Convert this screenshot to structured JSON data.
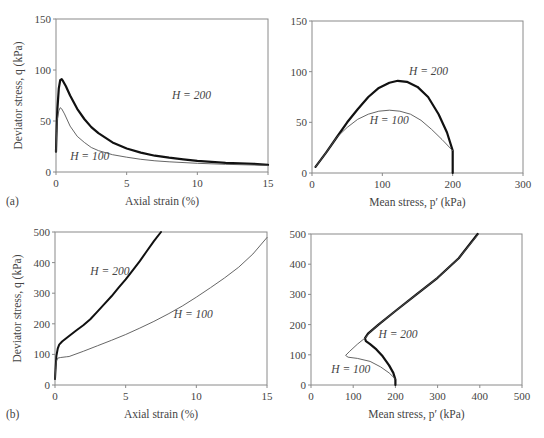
{
  "chart_data": [
    {
      "id": "a_left",
      "panel_tag": "(a)",
      "type": "line",
      "xlabel": "Axial strain (%)",
      "ylabel": "Deviator stress, q (kPa)",
      "xlim": [
        0,
        15
      ],
      "ylim": [
        0,
        150
      ],
      "xticks": [
        0,
        5,
        10,
        15
      ],
      "yticks": [
        0,
        50,
        100,
        150
      ],
      "grid": false,
      "frame": {
        "x0": 56,
        "y0": 19,
        "x1": 268,
        "y1": 172
      },
      "series": [
        {
          "name": "H = 200",
          "width": 2.2,
          "label_pos": [
            8.2,
            72
          ],
          "points": [
            [
              0,
              20
            ],
            [
              0.05,
              45
            ],
            [
              0.1,
              62
            ],
            [
              0.2,
              82
            ],
            [
              0.3,
              90
            ],
            [
              0.4,
              91
            ],
            [
              0.5,
              89
            ],
            [
              0.7,
              84
            ],
            [
              1,
              75
            ],
            [
              1.5,
              62
            ],
            [
              2,
              52
            ],
            [
              2.5,
              44
            ],
            [
              3,
              38
            ],
            [
              4,
              29
            ],
            [
              5,
              23
            ],
            [
              6,
              19
            ],
            [
              7,
              16
            ],
            [
              8,
              14
            ],
            [
              9,
              12.5
            ],
            [
              10,
              11
            ],
            [
              11,
              10
            ],
            [
              12,
              9
            ],
            [
              13,
              8.5
            ],
            [
              14,
              8
            ],
            [
              15,
              7
            ]
          ]
        },
        {
          "name": "H = 100",
          "width": 0.9,
          "label_pos": [
            1.0,
            12
          ],
          "points": [
            [
              0,
              20
            ],
            [
              0.05,
              40
            ],
            [
              0.1,
              52
            ],
            [
              0.2,
              60
            ],
            [
              0.3,
              63
            ],
            [
              0.4,
              62
            ],
            [
              0.6,
              57
            ],
            [
              0.8,
              51
            ],
            [
              1,
              45
            ],
            [
              1.5,
              35
            ],
            [
              2,
              29
            ],
            [
              2.5,
              24
            ],
            [
              3,
              21
            ],
            [
              4,
              17
            ],
            [
              5,
              14.5
            ],
            [
              6,
              12.5
            ],
            [
              7,
              11
            ],
            [
              8,
              10
            ],
            [
              10,
              8.5
            ],
            [
              12,
              7.5
            ],
            [
              15,
              6.5
            ]
          ]
        }
      ]
    },
    {
      "id": "a_right",
      "type": "line",
      "xlabel": "Mean stress, p′ (kPa)",
      "ylabel": "",
      "xlim": [
        0,
        300
      ],
      "ylim": [
        0,
        150
      ],
      "xticks": [
        0,
        100,
        200,
        300
      ],
      "yticks": [
        0,
        50,
        100,
        150
      ],
      "grid": false,
      "frame": {
        "x0": 312,
        "y0": 21,
        "x1": 523,
        "y1": 173
      },
      "series": [
        {
          "name": "H = 200",
          "width": 2.2,
          "label_pos": [
            138,
            97
          ],
          "points": [
            [
              5,
              6
            ],
            [
              20,
              20
            ],
            [
              35,
              35
            ],
            [
              50,
              50
            ],
            [
              65,
              63
            ],
            [
              80,
              75
            ],
            [
              95,
              84
            ],
            [
              110,
              89
            ],
            [
              122,
              91
            ],
            [
              135,
              90
            ],
            [
              150,
              85
            ],
            [
              165,
              75
            ],
            [
              180,
              58
            ],
            [
              192,
              40
            ],
            [
              200,
              22
            ],
            [
              200,
              0
            ]
          ]
        },
        {
          "name": "H = 100",
          "width": 0.9,
          "label_pos": [
            82,
            48
          ],
          "points": [
            [
              5,
              6
            ],
            [
              20,
              20
            ],
            [
              35,
              35
            ],
            [
              50,
              45
            ],
            [
              65,
              53
            ],
            [
              80,
              58
            ],
            [
              95,
              61
            ],
            [
              110,
              62
            ],
            [
              125,
              61
            ],
            [
              140,
              58
            ],
            [
              155,
              52
            ],
            [
              170,
              43
            ],
            [
              185,
              33
            ],
            [
              200,
              22
            ]
          ]
        }
      ]
    },
    {
      "id": "b_left",
      "panel_tag": "(b)",
      "type": "line",
      "xlabel": "Axial strain (%)",
      "ylabel": "Deviator stress, q (kPa)",
      "xlim": [
        0,
        15
      ],
      "ylim": [
        0,
        500
      ],
      "xticks": [
        0,
        5,
        10,
        15
      ],
      "yticks": [
        0,
        100,
        200,
        300,
        400,
        500
      ],
      "grid": false,
      "frame": {
        "x0": 55,
        "y0": 232,
        "x1": 267,
        "y1": 385
      },
      "series": [
        {
          "name": "H = 200",
          "width": 2.0,
          "label_pos": [
            2.5,
            360
          ],
          "points": [
            [
              0,
              20
            ],
            [
              0.05,
              60
            ],
            [
              0.1,
              95
            ],
            [
              0.2,
              120
            ],
            [
              0.3,
              132
            ],
            [
              0.5,
              142
            ],
            [
              1,
              160
            ],
            [
              1.5,
              178
            ],
            [
              2,
              195
            ],
            [
              2.5,
              215
            ],
            [
              3,
              240
            ],
            [
              3.5,
              265
            ],
            [
              4,
              290
            ],
            [
              4.5,
              318
            ],
            [
              5,
              345
            ],
            [
              5.5,
              375
            ],
            [
              6,
              405
            ],
            [
              6.5,
              438
            ],
            [
              7,
              470
            ],
            [
              7.5,
              500
            ]
          ]
        },
        {
          "name": "H = 100",
          "width": 0.9,
          "label_pos": [
            8.4,
            220
          ],
          "points": [
            [
              0,
              20
            ],
            [
              0.05,
              55
            ],
            [
              0.1,
              78
            ],
            [
              0.2,
              88
            ],
            [
              0.4,
              90
            ],
            [
              0.8,
              92
            ],
            [
              1,
              93
            ],
            [
              2,
              110
            ],
            [
              3,
              128
            ],
            [
              4,
              146
            ],
            [
              5,
              165
            ],
            [
              6,
              186
            ],
            [
              7,
              208
            ],
            [
              8,
              232
            ],
            [
              9,
              258
            ],
            [
              10,
              287
            ],
            [
              11,
              318
            ],
            [
              12,
              350
            ],
            [
              13,
              385
            ],
            [
              14,
              428
            ],
            [
              15,
              482
            ]
          ]
        }
      ]
    },
    {
      "id": "b_right",
      "type": "line",
      "xlabel": "Mean stress, p′ (kPa)",
      "ylabel": "",
      "xlim": [
        0,
        500
      ],
      "ylim": [
        0,
        500
      ],
      "xticks": [
        0,
        100,
        200,
        300,
        400,
        500
      ],
      "yticks": [
        0,
        100,
        200,
        300,
        400,
        500
      ],
      "grid": false,
      "frame": {
        "x0": 311,
        "y0": 234,
        "x1": 522,
        "y1": 385
      },
      "series": [
        {
          "name": "H = 200",
          "width": 2.2,
          "label_pos": [
            160,
            155
          ],
          "points": [
            [
              200,
              0
            ],
            [
              200,
              18
            ],
            [
              195,
              40
            ],
            [
              185,
              65
            ],
            [
              170,
              95
            ],
            [
              155,
              118
            ],
            [
              140,
              135
            ],
            [
              130,
              145
            ],
            [
              128,
              155
            ],
            [
              135,
              170
            ],
            [
              160,
              200
            ],
            [
              200,
              245
            ],
            [
              250,
              300
            ],
            [
              300,
              355
            ],
            [
              350,
              420
            ],
            [
              395,
              500
            ]
          ]
        },
        {
          "name": "H = 100",
          "width": 0.9,
          "label_pos": [
            48,
            40
          ],
          "points": [
            [
              200,
              20
            ],
            [
              185,
              40
            ],
            [
              165,
              60
            ],
            [
              140,
              78
            ],
            [
              110,
              88
            ],
            [
              88,
              92
            ],
            [
              82,
              98
            ],
            [
              92,
              112
            ],
            [
              110,
              135
            ],
            [
              130,
              158
            ],
            [
              140,
              175
            ],
            [
              160,
              200
            ],
            [
              200,
              245
            ],
            [
              250,
              300
            ],
            [
              300,
              355
            ],
            [
              350,
              420
            ],
            [
              397,
              500
            ]
          ]
        }
      ]
    }
  ]
}
